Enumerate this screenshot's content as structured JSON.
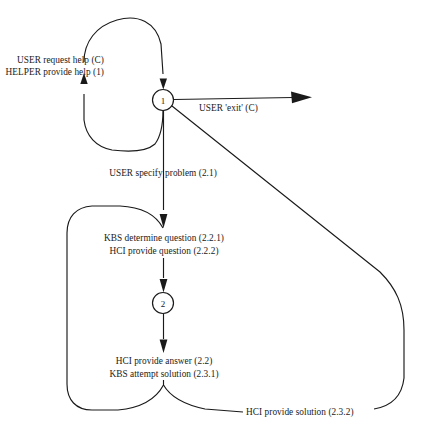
{
  "diagram": {
    "type": "state-transition-diagram",
    "background_color": "#ffffff",
    "line_color": "#1a1a1a",
    "nodes": [
      {
        "id": "node-1",
        "label": "1",
        "cx": 163,
        "cy": 100,
        "r": 10.5
      },
      {
        "id": "node-2",
        "label": "2",
        "cx": 163,
        "cy": 303,
        "r": 10.5
      }
    ],
    "labels": {
      "help_loop_line1": "USER request help (C)",
      "help_loop_line2": "HELPER provide help (1)",
      "exit": "USER 'exit' (C)",
      "specify_problem": "USER specify problem (2.1)",
      "determine_question": "KBS determine question (2.2.1)",
      "provide_question": "HCI provide question (2.2.2)",
      "provide_answer": "HCI provide answer (2.2)",
      "attempt_solution": "KBS attempt solution (2.3.1)",
      "provide_solution": "HCI provide solution (2.3.2)"
    },
    "edges": [
      {
        "name": "help-request-loop",
        "from": "node-1",
        "to": "node-1",
        "labels": [
          "USER request help (C)",
          "HELPER provide help (1)"
        ],
        "arrowheads": 2,
        "shape": "left self-loop around node 1"
      },
      {
        "name": "exit-transition",
        "from": "node-1",
        "to": "terminal",
        "labels": [
          "USER 'exit' (C)"
        ],
        "arrowheads": 1,
        "shape": "horizontal right arrow"
      },
      {
        "name": "specify-problem-transition",
        "from": "node-1",
        "to": "determine-question",
        "labels": [
          "USER specify problem (2.1)"
        ],
        "arrowheads": 1,
        "shape": "vertical down arrow"
      },
      {
        "name": "question-to-node2",
        "from": "determine-question",
        "to": "node-2",
        "labels": [],
        "arrowheads": 1,
        "shape": "vertical down arrow"
      },
      {
        "name": "node2-to-answer",
        "from": "node-2",
        "to": "provide-answer",
        "labels": [],
        "arrowheads": 1,
        "shape": "vertical down arrow"
      },
      {
        "name": "question-retry-loop",
        "from": "provide-answer",
        "to": "determine-question",
        "labels": [],
        "arrowheads": 0,
        "shape": "inner left loop"
      },
      {
        "name": "provide-solution-loop",
        "from": "attempt-solution",
        "to": "node-1",
        "labels": [
          "HCI provide solution (2.3.2)"
        ],
        "arrowheads": 0,
        "shape": "outer right loop back to node 1"
      }
    ]
  }
}
